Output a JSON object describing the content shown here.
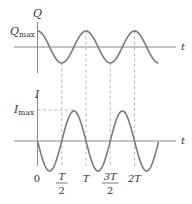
{
  "figure": {
    "top_plot": {
      "y_axis_label": "Q",
      "max_label_main": "Q",
      "max_label_sub": "max",
      "x_axis_label": "t",
      "curve": "Q = Qmax cos(2πt/T)"
    },
    "bottom_plot": {
      "y_axis_label": "I",
      "max_label_main": "I",
      "max_label_sub": "max",
      "x_axis_label": "t",
      "curve": "I = -Imax sin(2πt/T)"
    },
    "tick_labels": {
      "zero": "0",
      "half_T_num": "T",
      "half_T_den": "2",
      "T": "T",
      "three_half_T_num": "3T",
      "three_half_T_den": "2",
      "two_T": "2T"
    },
    "colors": {
      "curve": "#7a7a7a",
      "axis": "#8a8a8a",
      "dashed": "#b0b0b0",
      "text": "#333333"
    }
  }
}
